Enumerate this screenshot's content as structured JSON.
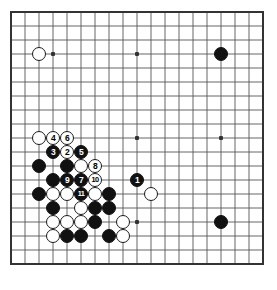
{
  "diagram": {
    "kind": "go-board-diagram",
    "board_size": 19,
    "visible_region": {
      "cols": 19,
      "rows": 19
    },
    "colors": {
      "background": "#ffffff",
      "grid_line": "#555555",
      "border_line": "#333333",
      "black_stone": "#111111",
      "white_stone": "#ffffff",
      "stone_outline": "#1a1a1a",
      "black_label_text": "#ffffff",
      "white_label_text": "#000000"
    },
    "geometry": {
      "origin_x": 11,
      "origin_y": 12,
      "spacing": 14,
      "stone_radius": 7.4,
      "label_font_size": 8.5
    },
    "star_points": [
      {
        "col": 3,
        "row": 3
      },
      {
        "col": 9,
        "row": 3
      },
      {
        "col": 15,
        "row": 3
      },
      {
        "col": 3,
        "row": 9
      },
      {
        "col": 9,
        "row": 9
      },
      {
        "col": 15,
        "row": 9
      },
      {
        "col": 3,
        "row": 15
      },
      {
        "col": 9,
        "row": 15
      },
      {
        "col": 15,
        "row": 15
      }
    ],
    "stones": [
      {
        "col": 2,
        "row": 3,
        "color": "white",
        "label": ""
      },
      {
        "col": 15,
        "row": 3,
        "color": "black",
        "label": ""
      },
      {
        "col": 2,
        "row": 9,
        "color": "white",
        "label": ""
      },
      {
        "col": 3,
        "row": 9,
        "color": "white",
        "label": "4"
      },
      {
        "col": 4,
        "row": 9,
        "color": "white",
        "label": "6"
      },
      {
        "col": 3,
        "row": 10,
        "color": "black",
        "label": "3"
      },
      {
        "col": 4,
        "row": 10,
        "color": "white",
        "label": "2"
      },
      {
        "col": 5,
        "row": 10,
        "color": "black",
        "label": "5"
      },
      {
        "col": 2,
        "row": 11,
        "color": "black",
        "label": ""
      },
      {
        "col": 4,
        "row": 11,
        "color": "black",
        "label": ""
      },
      {
        "col": 5,
        "row": 11,
        "color": "white",
        "label": ""
      },
      {
        "col": 6,
        "row": 11,
        "color": "white",
        "label": "8"
      },
      {
        "col": 3,
        "row": 12,
        "color": "black",
        "label": ""
      },
      {
        "col": 4,
        "row": 12,
        "color": "black",
        "label": "9"
      },
      {
        "col": 5,
        "row": 12,
        "color": "black",
        "label": "7"
      },
      {
        "col": 6,
        "row": 12,
        "color": "white",
        "label": "10"
      },
      {
        "col": 9,
        "row": 12,
        "color": "black",
        "label": "1"
      },
      {
        "col": 2,
        "row": 13,
        "color": "black",
        "label": ""
      },
      {
        "col": 3,
        "row": 13,
        "color": "white",
        "label": ""
      },
      {
        "col": 4,
        "row": 13,
        "color": "white",
        "label": ""
      },
      {
        "col": 5,
        "row": 13,
        "color": "black",
        "label": "11"
      },
      {
        "col": 6,
        "row": 13,
        "color": "white",
        "label": ""
      },
      {
        "col": 7,
        "row": 13,
        "color": "black",
        "label": ""
      },
      {
        "col": 10,
        "row": 13,
        "color": "white",
        "label": ""
      },
      {
        "col": 3,
        "row": 14,
        "color": "black",
        "label": ""
      },
      {
        "col": 5,
        "row": 14,
        "color": "white",
        "label": ""
      },
      {
        "col": 6,
        "row": 14,
        "color": "black",
        "label": ""
      },
      {
        "col": 7,
        "row": 14,
        "color": "black",
        "label": ""
      },
      {
        "col": 3,
        "row": 15,
        "color": "white",
        "label": ""
      },
      {
        "col": 4,
        "row": 15,
        "color": "white",
        "label": ""
      },
      {
        "col": 5,
        "row": 15,
        "color": "white",
        "label": ""
      },
      {
        "col": 6,
        "row": 15,
        "color": "black",
        "label": ""
      },
      {
        "col": 8,
        "row": 15,
        "color": "white",
        "label": ""
      },
      {
        "col": 15,
        "row": 15,
        "color": "black",
        "label": ""
      },
      {
        "col": 3,
        "row": 16,
        "color": "white",
        "label": ""
      },
      {
        "col": 4,
        "row": 16,
        "color": "black",
        "label": ""
      },
      {
        "col": 5,
        "row": 16,
        "color": "black",
        "label": ""
      },
      {
        "col": 7,
        "row": 16,
        "color": "black",
        "label": ""
      },
      {
        "col": 8,
        "row": 16,
        "color": "white",
        "label": ""
      }
    ],
    "move_sequence": [
      {
        "number": "1",
        "color": "black"
      },
      {
        "number": "2",
        "color": "white"
      },
      {
        "number": "3",
        "color": "black"
      },
      {
        "number": "4",
        "color": "white"
      },
      {
        "number": "5",
        "color": "black"
      },
      {
        "number": "6",
        "color": "white"
      },
      {
        "number": "7",
        "color": "black"
      },
      {
        "number": "8",
        "color": "white"
      },
      {
        "number": "9",
        "color": "black"
      },
      {
        "number": "10",
        "color": "white"
      },
      {
        "number": "11",
        "color": "black"
      }
    ]
  }
}
